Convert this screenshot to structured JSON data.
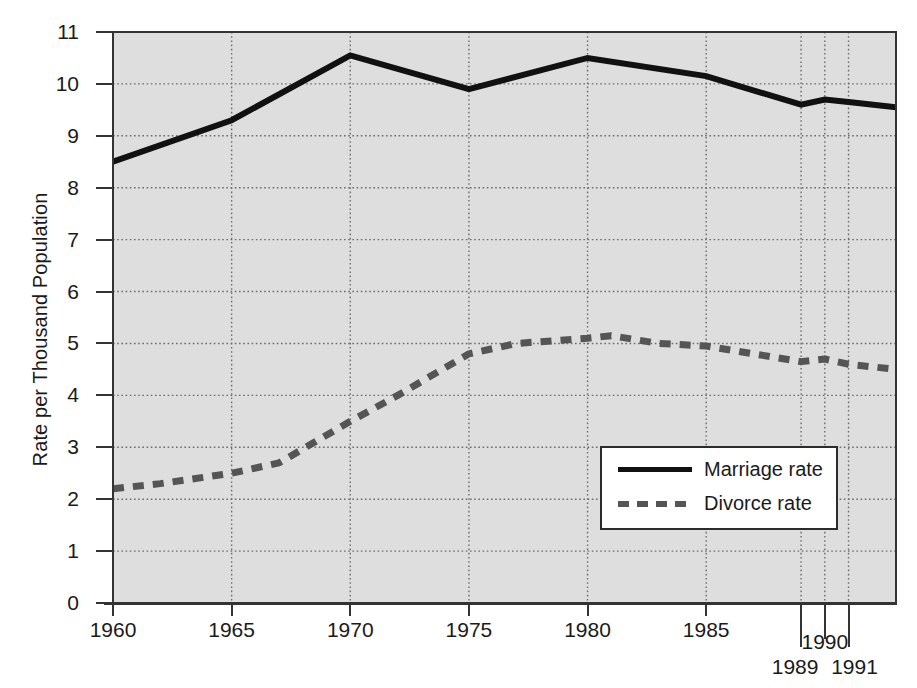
{
  "chart_data": {
    "type": "line",
    "title": "",
    "xlabel": "",
    "ylabel": "Rate per Thousand Population",
    "xlim": [
      1960,
      1993
    ],
    "ylim": [
      0,
      11
    ],
    "grid": true,
    "legend_position": "lower-right",
    "background": "#dedede",
    "x_tick_labels": [
      "1960",
      "1965",
      "1970",
      "1975",
      "1980",
      "1985",
      "1990"
    ],
    "x_tick_values": [
      1960,
      1965,
      1970,
      1975,
      1980,
      1985,
      1990
    ],
    "x_extra_tick_labels": [
      "1989",
      "1991"
    ],
    "x_extra_tick_values": [
      1989,
      1991
    ],
    "y_tick_labels": [
      "0",
      "1",
      "2",
      "3",
      "4",
      "5",
      "6",
      "7",
      "8",
      "9",
      "10",
      "11"
    ],
    "y_tick_values": [
      0,
      1,
      2,
      3,
      4,
      5,
      6,
      7,
      8,
      9,
      10,
      11
    ],
    "series": [
      {
        "name": "Marriage rate",
        "style": "solid",
        "color": "#111111",
        "x": [
          1960,
          1965,
          1970,
          1975,
          1980,
          1985,
          1989,
          1990,
          1991,
          1993
        ],
        "values": [
          8.5,
          9.3,
          10.55,
          9.9,
          10.5,
          10.15,
          9.6,
          9.7,
          9.65,
          9.55
        ]
      },
      {
        "name": "Divorce rate",
        "style": "dashed",
        "color": "#555555",
        "x": [
          1960,
          1962,
          1965,
          1967,
          1970,
          1972,
          1975,
          1977,
          1980,
          1981,
          1983,
          1985,
          1987,
          1989,
          1990,
          1991,
          1993
        ],
        "values": [
          2.2,
          2.3,
          2.5,
          2.7,
          3.5,
          4.0,
          4.8,
          5.0,
          5.1,
          5.15,
          5.0,
          4.95,
          4.8,
          4.65,
          4.7,
          4.6,
          4.5
        ]
      }
    ]
  },
  "legend": {
    "entries": [
      {
        "label": "Marriage rate",
        "swatch": "solid-line-swatch"
      },
      {
        "label": "Divorce rate",
        "swatch": "dashed-line-swatch"
      }
    ]
  }
}
